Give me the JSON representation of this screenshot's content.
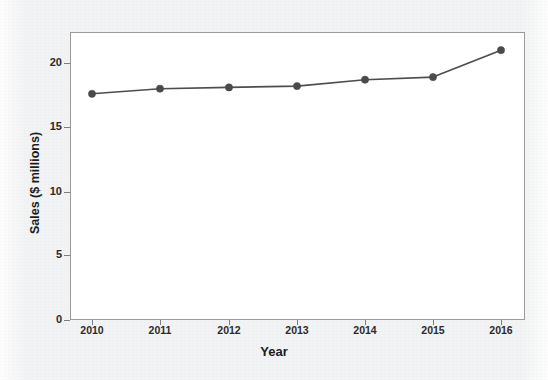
{
  "chart_data": {
    "type": "line",
    "title": "",
    "xlabel": "Year",
    "ylabel": "Sales ($ millions)",
    "categories": [
      "2010",
      "2011",
      "2012",
      "2013",
      "2014",
      "2015",
      "2016"
    ],
    "values": [
      17.6,
      18.0,
      18.1,
      18.2,
      18.7,
      18.9,
      21.0
    ],
    "series": [
      {
        "name": "Sales",
        "values": [
          17.6,
          18.0,
          18.1,
          18.2,
          18.7,
          18.9,
          21.0
        ]
      }
    ],
    "ylim": [
      0,
      22.4
    ],
    "xlim": [
      "2010",
      "2016"
    ],
    "y_ticks": [
      "0",
      "5",
      "10",
      "15",
      "20"
    ],
    "y_tick_values": [
      0,
      5,
      10,
      15,
      20
    ],
    "x_ticks": [
      "2010",
      "2011",
      "2012",
      "2013",
      "2014",
      "2015",
      "2016"
    ],
    "grid": false,
    "legend": "none",
    "marker": "circle",
    "colors": {
      "line": "#4d4d4d",
      "marker": "#4a4a4a",
      "frame": "#9b9b9b",
      "text": "#1d1d1d",
      "plot_background": "#ffffff",
      "page_background": "#f2f3f4"
    }
  },
  "axes": {
    "y_title": "Sales ($ millions)",
    "x_title": "Year",
    "y_tick_labels": [
      "20",
      "15",
      "10",
      "5",
      "0"
    ],
    "x_tick_labels": [
      "2010",
      "2011",
      "2012",
      "2013",
      "2014",
      "2015",
      "2016"
    ]
  }
}
